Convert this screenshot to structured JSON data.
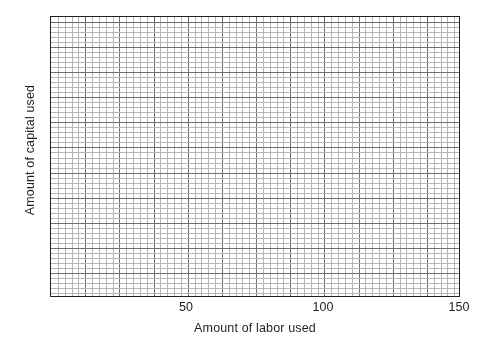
{
  "chart_data": {
    "type": "scatter",
    "title": "",
    "subtitle": "",
    "xlabel": "Amount of labor used",
    "ylabel": "Amount of capital used",
    "xlim": [
      0,
      150
    ],
    "ylim": [
      0,
      300
    ],
    "x_ticks": [
      {
        "value": 0,
        "label": ""
      },
      {
        "value": 50,
        "label": "50"
      },
      {
        "value": 100,
        "label": "100"
      },
      {
        "value": 150,
        "label": "150"
      }
    ],
    "y_ticks": [
      {
        "value": 0,
        "label": "0"
      },
      {
        "value": 100,
        "label": "100"
      },
      {
        "value": 200,
        "label": "200"
      },
      {
        "value": 300,
        "label": "300"
      }
    ],
    "x_tick_labels": [
      "50",
      "100",
      "150"
    ],
    "y_tick_labels": [
      "0",
      "100",
      "200",
      "300"
    ],
    "grid": {
      "visible": true,
      "style": "graph-paper",
      "minor_step_x": 2.5,
      "minor_step_y": 5,
      "major_every_n_minor": 5,
      "major_step_x": 12.5,
      "major_step_y": 25,
      "minor_columns": 60,
      "minor_rows": 56,
      "minor_color": "#b6b6b6",
      "major_color": "#6f6f6f"
    },
    "legend": {
      "visible": false,
      "position": "none",
      "entries": []
    },
    "series": [
      {
        "name": "",
        "x": [],
        "y": []
      }
    ],
    "annotations": []
  },
  "figure": {
    "frame_color": "#231f20",
    "background_color": "#ffffff",
    "text_color": "#231f20"
  }
}
